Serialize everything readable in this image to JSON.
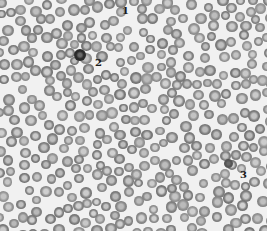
{
  "image": {
    "description": "Light micrograph of a peripheral blood smear showing numerous erythrocytes with central pallor and three numbered features",
    "background_color": "#f1f1f1",
    "cell_color": "#8d8d8d",
    "cell_rim_color": "#777777",
    "cell_center_color": "#c4c4c4"
  },
  "labels": [
    {
      "id": "1",
      "text": "1",
      "x": 122,
      "y": 6
    },
    {
      "id": "2",
      "text": "2",
      "x": 95,
      "y": 58
    },
    {
      "id": "3",
      "text": "3",
      "x": 240,
      "y": 170
    }
  ],
  "markers": [
    {
      "id": "leukocyte",
      "x": 80,
      "y": 55,
      "size": 12,
      "color": "#2b2b2b"
    },
    {
      "id": "platelet-clump",
      "x": 228,
      "y": 163,
      "size": 9,
      "color": "#555555"
    }
  ]
}
